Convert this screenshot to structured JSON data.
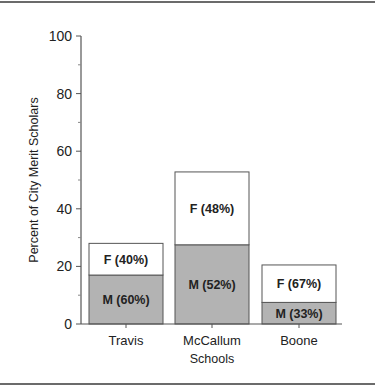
{
  "chart_data": {
    "type": "bar",
    "stacked": true,
    "title": "",
    "xlabel": "Schools",
    "ylabel": "Percent of City Merit Scholars",
    "ylim": [
      0,
      100
    ],
    "yticks": [
      0,
      20,
      40,
      60,
      80,
      100
    ],
    "minor_yticks": [
      10,
      30,
      50,
      70,
      90
    ],
    "grid": false,
    "legend": null,
    "categories": [
      "Travis",
      "McCallum",
      "Boone"
    ],
    "series": [
      {
        "name": "M",
        "color": "#b3b3b3",
        "values": [
          17,
          27.5,
          7.5
        ],
        "labels": [
          "M (60%)",
          "M (52%)",
          "M (33%)"
        ]
      },
      {
        "name": "F",
        "color": "#ffffff",
        "values": [
          11,
          25.3,
          13
        ],
        "labels": [
          "F (40%)",
          "F (48%)",
          "F (67%)"
        ]
      }
    ],
    "totals": [
      28,
      52.8,
      20.5
    ]
  }
}
